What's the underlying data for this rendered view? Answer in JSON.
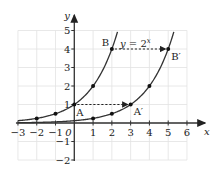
{
  "chart_data": {
    "type": "line",
    "title": "",
    "xlabel": "x",
    "ylabel": "y",
    "xlim": [
      -3,
      6
    ],
    "ylim": [
      -2,
      5
    ],
    "grid": true,
    "x_ticks": [
      "-3",
      "-2",
      "-1",
      "0",
      "1",
      "2",
      "3",
      "4",
      "5",
      "6"
    ],
    "y_ticks": [
      "-2",
      "-1",
      "1",
      "2",
      "3",
      "4",
      "5"
    ],
    "origin_label": "0",
    "series": [
      {
        "name": "y = 2^x",
        "label": "y = 2",
        "label_exponent": "x",
        "function": "2^x",
        "marked_points": [
          [
            -2,
            0.25
          ],
          [
            -1,
            0.5
          ],
          [
            0,
            1
          ],
          [
            1,
            2
          ],
          [
            2,
            4
          ]
        ]
      },
      {
        "name": "translated curve",
        "function": "2^(x-3)",
        "marked_points": [
          [
            1,
            0.25
          ],
          [
            2,
            0.5
          ],
          [
            3,
            1
          ],
          [
            4,
            2
          ],
          [
            5,
            4
          ]
        ]
      }
    ],
    "annotations": [
      {
        "label": "A",
        "at": [
          0,
          1
        ]
      },
      {
        "label": "A′",
        "at": [
          3,
          1
        ]
      },
      {
        "label": "B",
        "at": [
          2,
          4
        ]
      },
      {
        "label": "B′",
        "at": [
          5,
          4
        ]
      }
    ],
    "arrows": [
      {
        "from": "A",
        "to": "A′",
        "style": "dotted"
      },
      {
        "from": "B",
        "to": "B′",
        "style": "dotted"
      }
    ]
  },
  "colors": {
    "grid": "#e2e2e2",
    "axis": "#333333",
    "curve": "#333333",
    "point": "#111111"
  }
}
